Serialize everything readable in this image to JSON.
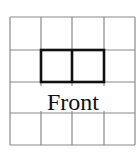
{
  "diagram": {
    "grid": {
      "cols": 4,
      "rows": 4,
      "x_lines": [
        10,
        41,
        72,
        104,
        135
      ],
      "y_lines": [
        17,
        50,
        82,
        113,
        145
      ],
      "color": "#8a8a8a"
    },
    "highlight": {
      "cells": [
        [
          1,
          1
        ],
        [
          1,
          2
        ]
      ],
      "x": 41,
      "y": 50,
      "width": 63,
      "height": 32,
      "divider_x": 72,
      "color": "#111111"
    },
    "label": {
      "text": "Front",
      "x": 73,
      "y": 110
    }
  }
}
